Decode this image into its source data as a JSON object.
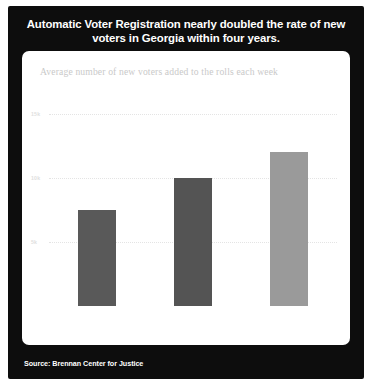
{
  "figure": {
    "title": "Automatic Voter Registration nearly doubled the rate of new voters in Georgia within four years.",
    "subtitle": "Average number of new voters added to the rolls each week",
    "source": "Source: Brennan Center for Justice",
    "frame_color": "#0d0d0d",
    "card_color": "#ffffff"
  },
  "chart_data": {
    "type": "bar",
    "title": "Automatic Voter Registration nearly doubled the rate of new voters in Georgia within four years.",
    "subtitle": "Average number of new voters added to the rolls each week",
    "xlabel": "",
    "ylabel": "",
    "categories": [
      "2013",
      "2015",
      "2017"
    ],
    "values": [
      7500,
      10000,
      12000
    ],
    "bar_colors": [
      "#595959",
      "#545454",
      "#9a9a9a"
    ],
    "ylim": [
      0,
      16250
    ],
    "yticks": [
      5000,
      10000,
      15000
    ],
    "ytick_labels": [
      "5k",
      "10k",
      "15k"
    ],
    "grid": "horizontal-dotted",
    "legend": "none",
    "annotations": [
      {
        "text": "Pre-AVR",
        "spans": [
          "2013",
          "2015"
        ]
      },
      {
        "text": "AVR implemented",
        "spans": [
          "2017"
        ]
      }
    ]
  }
}
